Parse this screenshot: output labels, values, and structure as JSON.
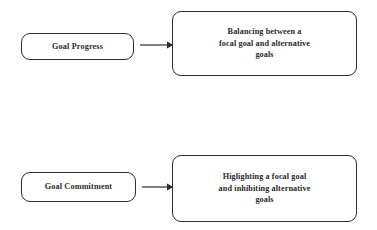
{
  "diagram": {
    "background_color": "#ffffff",
    "stroke_color": "#2e2e2e",
    "text_color": "#2b2b2b",
    "rows": [
      {
        "id": "row-progress",
        "antecedent": "Goal Progress",
        "arrow": "right-arrow",
        "outcome": "Balancing between a\nfocal goal and alternative\ngoals"
      },
      {
        "id": "row-commitment",
        "antecedent": "Goal Commitment",
        "arrow": "right-arrow",
        "outcome": "Higlighting a focal goal\nand inhibiting alternative\ngoals"
      }
    ]
  }
}
